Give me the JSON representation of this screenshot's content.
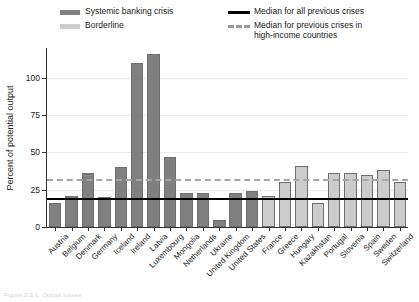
{
  "legend": {
    "items": [
      {
        "label": "Systemic banking crisis",
        "marker": "swatch",
        "color": "#808080"
      },
      {
        "label": "Borderline",
        "marker": "swatch",
        "color": "#cccccc"
      },
      {
        "label": "Median for all previous crises",
        "marker": "solid-line",
        "color": "#000000"
      },
      {
        "label": "Median for previous crises in\nhigh-income countries",
        "marker": "dashed-line",
        "color": "#a6a6a6"
      }
    ]
  },
  "axis": {
    "y_title": "Percent of potential output",
    "y_ticks": [
      "0",
      "25",
      "50",
      "75",
      "100"
    ]
  },
  "caption": "Figure 2.3.1. Output losses",
  "chart_data": {
    "type": "bar",
    "title": "",
    "xlabel": "",
    "ylabel": "Percent of potential output",
    "ylim": [
      0,
      120
    ],
    "yticks": [
      0,
      25,
      50,
      75,
      100
    ],
    "grid": true,
    "legend_position": "top",
    "categories": [
      "Austria",
      "Belgium",
      "Denmark",
      "Germany",
      "Iceland",
      "Ireland",
      "Latvia",
      "Luxembourg",
      "Mongolia",
      "Netherlands",
      "Ukraine",
      "United Kingdom",
      "United States",
      "France",
      "Greece",
      "Hungary",
      "Kazakhstan",
      "Portugal",
      "Slovenia",
      "Spain",
      "Sweden",
      "Switzerland"
    ],
    "values": [
      16,
      21,
      36,
      20,
      40,
      110,
      116,
      47,
      23,
      23,
      5,
      23,
      24,
      21,
      30,
      41,
      16,
      36,
      36,
      35,
      38,
      30
    ],
    "series_group": [
      "systemic",
      "systemic",
      "systemic",
      "systemic",
      "systemic",
      "systemic",
      "systemic",
      "systemic",
      "systemic",
      "systemic",
      "systemic",
      "systemic",
      "systemic",
      "borderline",
      "borderline",
      "borderline",
      "borderline",
      "borderline",
      "borderline",
      "borderline",
      "borderline",
      "borderline"
    ],
    "reference_lines": [
      {
        "name": "Median for all previous crises",
        "value": 19.5,
        "style": "solid",
        "color": "#000000"
      },
      {
        "name": "Median for previous crises in high-income countries",
        "value": 32,
        "style": "dashed",
        "color": "#a6a6a6"
      }
    ],
    "colors": {
      "systemic": "#808080",
      "borderline": "#cccccc"
    }
  }
}
